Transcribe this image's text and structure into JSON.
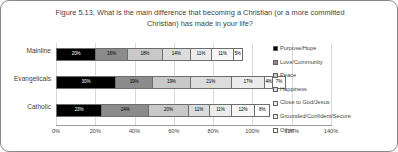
{
  "figure": {
    "title_line1": "Figure 5.13, What is the main difference that becoming a Christian (or a more",
    "title_line2": "committed Christian) has made in your life?"
  },
  "chart_data": {
    "type": "bar",
    "orientation": "horizontal",
    "stacked": true,
    "title": "Figure 5.13, What is the main difference that becoming a Christian (or a more committed Christian) has made in your life?",
    "xlabel": "",
    "ylabel": "",
    "xlim": [
      0,
      140
    ],
    "grid": true,
    "legend_position": "right",
    "xticks": [
      "0%",
      "20%",
      "40%",
      "60%",
      "80%",
      "100%",
      "120%",
      "140%"
    ],
    "xtick_values": [
      0,
      20,
      40,
      60,
      80,
      100,
      120,
      140
    ],
    "categories": [
      "Mainline",
      "Evangelicals",
      "Catholic"
    ],
    "series": [
      {
        "name": "Purpose/Hope",
        "color": "#000000",
        "text_color": "#ffffff",
        "values": [
          20,
          30,
          23
        ],
        "labels": [
          "20%",
          "30%",
          "23%"
        ]
      },
      {
        "name": "Love/Community",
        "color": "#8c8c8c",
        "text_color": "#000000",
        "values": [
          16,
          19,
          24
        ],
        "labels": [
          "16%",
          "19%",
          "24%"
        ]
      },
      {
        "name": "Peace",
        "color": "#c8c8c8",
        "text_color": "#000000",
        "values": [
          18,
          19,
          20
        ],
        "labels": [
          "18%",
          "19%",
          "20%"
        ]
      },
      {
        "name": "Happiness",
        "color": "#dcdcdc",
        "text_color": "#000000",
        "values": [
          14,
          21,
          11
        ],
        "labels": [
          "14%",
          "21%",
          "11%"
        ]
      },
      {
        "name": "Close to God/Jesus",
        "color": "#ececec",
        "text_color": "#000000",
        "values": [
          11,
          17,
          11
        ],
        "labels": [
          "11%",
          "17%",
          "11%"
        ]
      },
      {
        "name": "Grounded/Confident/Secure",
        "color": "#f6f6f6",
        "text_color": "#000000",
        "values": [
          11,
          4,
          12
        ],
        "labels": [
          "11%",
          "4%",
          "12%"
        ]
      },
      {
        "name": "Other",
        "color": "#ffffff",
        "text_color": "#000000",
        "values": [
          5,
          7,
          8
        ],
        "labels": [
          "5%",
          "7%",
          "8%"
        ]
      }
    ]
  }
}
